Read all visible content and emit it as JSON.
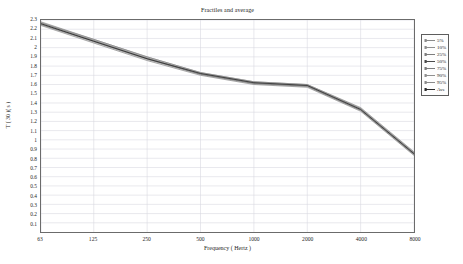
{
  "chart_data": {
    "type": "line",
    "title": "Fractiles and average",
    "xlabel": "Frequency ( Hertz )",
    "ylabel": "T ( 30 )( s )",
    "x": [
      63,
      125,
      250,
      500,
      1000,
      2000,
      4000,
      8000
    ],
    "x_scale": "log",
    "xticklabels": [
      "63",
      "125",
      "250",
      "500",
      "1000",
      "2000",
      "4000",
      "8000"
    ],
    "ylim": [
      0,
      2.3
    ],
    "yticklabels": [
      "2.3",
      "2.2",
      "2.1",
      "2",
      "1.9",
      "1.8",
      "1.7",
      "1.6",
      "1.5",
      "1.4",
      "1.3",
      "1.2",
      "1.1",
      "1",
      "0.9",
      "0.8",
      "0.7",
      "0.6",
      "0.5",
      "0.4",
      "0.3",
      "0.2",
      "0.1"
    ],
    "ytickvalues": [
      2.3,
      2.2,
      2.1,
      2.0,
      1.9,
      1.8,
      1.7,
      1.6,
      1.5,
      1.4,
      1.3,
      1.2,
      1.1,
      1.0,
      0.9,
      0.8,
      0.7,
      0.6,
      0.5,
      0.4,
      0.3,
      0.2,
      0.1
    ],
    "grid": true,
    "grid_color": "#d9d9e0",
    "legend_position": "right-outside",
    "series": [
      {
        "name": "5%",
        "color": "#8a8a8a",
        "values": [
          2.24,
          2.05,
          1.86,
          1.7,
          1.6,
          1.57,
          1.31,
          0.83
        ]
      },
      {
        "name": "10%",
        "color": "#8f8f8f",
        "values": [
          2.25,
          2.06,
          1.87,
          1.71,
          1.61,
          1.58,
          1.32,
          0.84
        ]
      },
      {
        "name": "25%",
        "color": "#7d7d7d",
        "values": [
          2.25,
          2.07,
          1.88,
          1.71,
          1.61,
          1.58,
          1.32,
          0.84
        ]
      },
      {
        "name": "50%",
        "color": "#4a4a4a",
        "values": [
          2.26,
          2.07,
          1.88,
          1.72,
          1.62,
          1.59,
          1.33,
          0.85
        ]
      },
      {
        "name": "75%",
        "color": "#7d7d7d",
        "values": [
          2.27,
          2.08,
          1.89,
          1.72,
          1.62,
          1.59,
          1.34,
          0.86
        ]
      },
      {
        "name": "90%",
        "color": "#8f8f8f",
        "values": [
          2.27,
          2.09,
          1.9,
          1.73,
          1.63,
          1.6,
          1.34,
          0.86
        ]
      },
      {
        "name": "95%",
        "color": "#8a8a8a",
        "values": [
          2.28,
          2.09,
          1.9,
          1.73,
          1.63,
          1.6,
          1.35,
          0.87
        ]
      },
      {
        "name": "Ave",
        "color": "#2b2b2b",
        "values": [
          2.26,
          2.07,
          1.88,
          1.72,
          1.62,
          1.59,
          1.33,
          0.85
        ]
      }
    ]
  },
  "legend": {
    "entries": [
      {
        "label": "5%"
      },
      {
        "label": "10%"
      },
      {
        "label": "25%"
      },
      {
        "label": "50%"
      },
      {
        "label": "75%"
      },
      {
        "label": "90%"
      },
      {
        "label": "95%"
      },
      {
        "label": "Ave"
      }
    ]
  },
  "colors": {
    "frame": "#6b6b6b",
    "grid": "#d9d9e0",
    "background": "#ffffff",
    "text": "#1f1f1f"
  }
}
